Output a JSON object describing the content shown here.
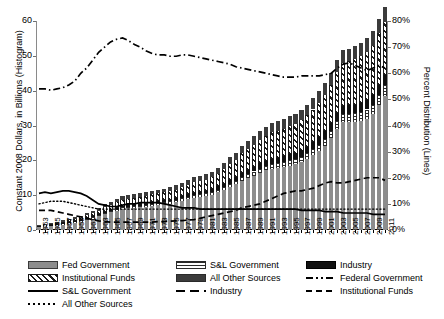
{
  "chart_data": {
    "type": "bar",
    "title": "",
    "xlabel": "",
    "ylabel": "Constant 2008 Dollars, in Billions (Histogram)",
    "ylabel_right": "Percent Distribution (Lines)",
    "ylim": [
      0,
      60
    ],
    "ylim_right": [
      0,
      80
    ],
    "yticks": [
      "0",
      "10",
      "20",
      "30",
      "40",
      "50",
      "60"
    ],
    "yticks_right": [
      "0%",
      "10%",
      "20%",
      "30%",
      "40%",
      "50%",
      "60%",
      "70%",
      "80%"
    ],
    "grid": false,
    "legend_position": "bottom",
    "categories": [
      "1953",
      "1954",
      "1955",
      "1956",
      "1957",
      "1958",
      "1959",
      "1960",
      "1961",
      "1962",
      "1963",
      "1964",
      "1965",
      "1966",
      "1967",
      "1968",
      "1969",
      "1970",
      "1971",
      "1972",
      "1973",
      "1974",
      "1975",
      "1976",
      "1977",
      "1978",
      "1979",
      "1980",
      "1981",
      "1982",
      "1983",
      "1984",
      "1985",
      "1986",
      "1987",
      "1988",
      "1989",
      "1990",
      "1991",
      "1992",
      "1993",
      "1994",
      "1995",
      "1996",
      "1997",
      "1998",
      "1999",
      "2000",
      "2001",
      "2002",
      "2003",
      "2004",
      "2005",
      "2006",
      "2007",
      "2008",
      "2009",
      "2010",
      "2011"
    ],
    "xtick_labels": [
      "1953",
      "1955",
      "1957",
      "1959",
      "1961",
      "1963",
      "1965",
      "1967",
      "1969",
      "1971",
      "1973",
      "1975",
      "1977",
      "1979",
      "1981",
      "1983",
      "1985",
      "1987",
      "1989",
      "1991",
      "1993",
      "1995",
      "1997",
      "1999",
      "2001",
      "2003",
      "2005",
      "2007",
      "2009",
      "2011"
    ],
    "series": [
      {
        "name": "Fed Government",
        "kind": "bar",
        "pattern": "solid-gray",
        "color": "#8d8d8d",
        "values": [
          0.9,
          1.1,
          1.2,
          1.4,
          1.6,
          1.9,
          2.2,
          2.5,
          2.9,
          3.3,
          3.9,
          4.6,
          5.1,
          5.6,
          6.0,
          6.2,
          6.4,
          6.5,
          6.7,
          7.0,
          7.2,
          7.4,
          7.6,
          8.0,
          8.4,
          8.9,
          9.3,
          9.6,
          9.8,
          10.1,
          10.8,
          11.4,
          12.4,
          13.1,
          14.2,
          14.9,
          15.6,
          16.3,
          17.1,
          17.6,
          17.9,
          18.2,
          18.5,
          18.9,
          19.5,
          20.3,
          21.4,
          22.6,
          24.2,
          26.3,
          29.0,
          30.9,
          31.0,
          31.0,
          31.4,
          32.0,
          33.2,
          36.0,
          38.6
        ]
      },
      {
        "name": "S&L Government",
        "kind": "bar",
        "pattern": "horizontal-lines",
        "color": "#ffffff",
        "values": [
          0.1,
          0.1,
          0.1,
          0.1,
          0.2,
          0.2,
          0.2,
          0.2,
          0.3,
          0.3,
          0.3,
          0.4,
          0.4,
          0.4,
          0.5,
          0.5,
          0.5,
          0.5,
          0.5,
          0.6,
          0.6,
          0.6,
          0.6,
          0.6,
          0.7,
          0.7,
          0.7,
          0.7,
          0.7,
          0.8,
          0.8,
          0.9,
          0.9,
          1.0,
          1.1,
          1.1,
          1.2,
          1.3,
          1.3,
          1.4,
          1.4,
          1.4,
          1.5,
          1.5,
          1.6,
          1.7,
          1.8,
          1.9,
          2.0,
          2.1,
          2.3,
          2.4,
          2.4,
          2.5,
          2.5,
          2.6,
          2.7,
          2.8,
          2.9
        ]
      },
      {
        "name": "Industry",
        "kind": "bar",
        "pattern": "solid-black",
        "color": "#111111",
        "values": [
          0.1,
          0.1,
          0.2,
          0.2,
          0.2,
          0.2,
          0.2,
          0.2,
          0.3,
          0.3,
          0.3,
          0.3,
          0.3,
          0.4,
          0.4,
          0.4,
          0.4,
          0.4,
          0.4,
          0.4,
          0.5,
          0.5,
          0.5,
          0.5,
          0.6,
          0.6,
          0.7,
          0.7,
          0.8,
          0.8,
          0.9,
          1.0,
          1.1,
          1.1,
          1.2,
          1.3,
          1.4,
          1.5,
          1.5,
          1.5,
          1.5,
          1.6,
          1.7,
          1.8,
          1.9,
          1.9,
          2.0,
          2.1,
          2.2,
          2.2,
          2.3,
          2.4,
          2.4,
          2.5,
          2.6,
          2.7,
          2.8,
          2.9,
          3.0
        ]
      },
      {
        "name": "Institutional Funds",
        "kind": "bar",
        "pattern": "diagonal-hatch",
        "color": "#ffffff",
        "values": [
          0.2,
          0.2,
          0.3,
          0.3,
          0.4,
          0.5,
          0.6,
          0.7,
          0.8,
          1.0,
          1.1,
          1.3,
          1.4,
          1.6,
          1.8,
          1.9,
          2.0,
          2.1,
          2.1,
          2.2,
          2.2,
          2.3,
          2.4,
          2.5,
          2.6,
          2.8,
          3.0,
          3.1,
          3.2,
          3.4,
          3.7,
          4.1,
          4.6,
          5.0,
          5.5,
          5.9,
          6.3,
          6.8,
          7.2,
          7.5,
          7.7,
          7.9,
          8.1,
          8.3,
          8.6,
          9.0,
          9.4,
          9.9,
          10.4,
          11.0,
          11.7,
          12.2,
          12.6,
          13.0,
          13.4,
          13.8,
          14.2,
          14.8,
          15.2
        ]
      },
      {
        "name": "All Other Sources",
        "kind": "bar",
        "pattern": "solid-dark",
        "color": "#3b3b3b",
        "values": [
          0.2,
          0.2,
          0.3,
          0.3,
          0.4,
          0.4,
          0.5,
          0.5,
          0.6,
          0.6,
          0.7,
          0.8,
          0.8,
          0.9,
          1.0,
          1.0,
          1.0,
          1.0,
          1.1,
          1.1,
          1.1,
          1.1,
          1.2,
          1.2,
          1.3,
          1.4,
          1.4,
          1.5,
          1.5,
          1.6,
          1.7,
          1.8,
          1.9,
          2.0,
          2.2,
          2.3,
          2.4,
          2.5,
          2.6,
          2.6,
          2.7,
          2.7,
          2.8,
          2.9,
          3.0,
          3.1,
          3.2,
          3.3,
          3.4,
          3.5,
          3.6,
          3.7,
          3.7,
          3.8,
          3.9,
          4.0,
          4.1,
          4.2,
          4.3
        ]
      },
      {
        "name": "Federal Government",
        "kind": "line",
        "pattern": "dash-dot",
        "axis": "right",
        "unit": "%",
        "values": [
          54,
          54,
          53.5,
          54,
          54.5,
          55.5,
          57,
          60,
          62,
          65,
          68,
          70,
          72,
          73,
          73.5,
          72.5,
          71,
          70,
          68.5,
          67.5,
          67,
          67,
          66.5,
          66.5,
          67,
          67,
          66.5,
          66,
          65.5,
          65,
          64.5,
          64,
          63.5,
          62.5,
          62,
          61.5,
          61,
          60.5,
          60,
          59.5,
          59,
          58.5,
          58.5,
          58.5,
          59,
          59,
          59,
          59,
          59.5,
          60,
          62,
          63.5,
          64,
          63,
          62,
          61,
          62,
          63,
          62
        ]
      },
      {
        "name": "Industry",
        "kind": "line",
        "pattern": "dashed",
        "axis": "right",
        "unit": "%",
        "values": [
          7.5,
          7.5,
          7.5,
          7,
          6.5,
          6,
          5.5,
          5,
          4.5,
          4,
          3.5,
          3.2,
          3,
          3,
          3,
          3,
          3,
          3,
          3,
          3,
          3.2,
          3.2,
          3.4,
          3.5,
          3.6,
          3.8,
          4,
          4.5,
          5,
          5.5,
          6,
          6.5,
          7,
          7.5,
          8.5,
          9,
          9.5,
          10,
          11,
          12,
          13,
          14,
          14.5,
          15,
          15,
          15.5,
          16,
          17,
          18,
          18.5,
          18,
          18,
          18.5,
          19,
          19.5,
          20,
          20,
          20,
          19
        ]
      },
      {
        "name": "S&L Government",
        "kind": "line",
        "pattern": "solid",
        "axis": "right",
        "unit": "%",
        "values": [
          14,
          14.5,
          14,
          14.5,
          15,
          15,
          14.5,
          14,
          13,
          11.5,
          10,
          9.5,
          9,
          9,
          9.5,
          10,
          10,
          10.5,
          10.5,
          10.5,
          10.5,
          10,
          9.5,
          9,
          8.5,
          8.5,
          8.5,
          8,
          8,
          8,
          8,
          8,
          8,
          8,
          8,
          8,
          8,
          8,
          8,
          8,
          8,
          8,
          8,
          8,
          7.5,
          7.5,
          7.5,
          7.5,
          7,
          7,
          7,
          6.5,
          6.5,
          6.5,
          6.5,
          6.5,
          6,
          6,
          6
        ]
      },
      {
        "name": "All Other Sources",
        "kind": "line",
        "pattern": "dotted",
        "axis": "right",
        "unit": "%",
        "values": [
          10,
          10.5,
          11,
          11,
          11,
          10.5,
          10,
          9.5,
          9,
          8.5,
          8,
          8,
          8,
          8,
          8,
          8,
          8,
          8,
          8,
          8,
          8,
          8,
          8,
          8,
          8,
          8,
          8,
          8,
          8,
          8,
          8,
          8,
          8,
          8,
          8,
          8,
          8,
          8,
          8,
          8,
          8,
          8,
          8,
          8,
          8,
          8,
          8,
          8,
          8,
          8,
          8,
          8,
          8,
          8,
          8,
          8,
          8,
          8,
          8
        ]
      }
    ],
    "legend": [
      {
        "label": "Fed Government",
        "swatch": "fed"
      },
      {
        "label": "S&L Government",
        "swatch": "snl"
      },
      {
        "label": "Industry",
        "swatch": "ind"
      },
      {
        "label": "Institutional Funds",
        "swatch": "inst"
      },
      {
        "label": "All Other Sources",
        "swatch": "other"
      },
      {
        "label": "Federal Government",
        "swatch": "dashdot"
      },
      {
        "label": "S&L Government",
        "swatch": "solid"
      },
      {
        "label": "Industry",
        "swatch": "dash"
      },
      {
        "label": "Institutional Funds",
        "swatch": "dashsm"
      },
      {
        "label": "All Other Sources",
        "swatch": "dot"
      }
    ]
  }
}
